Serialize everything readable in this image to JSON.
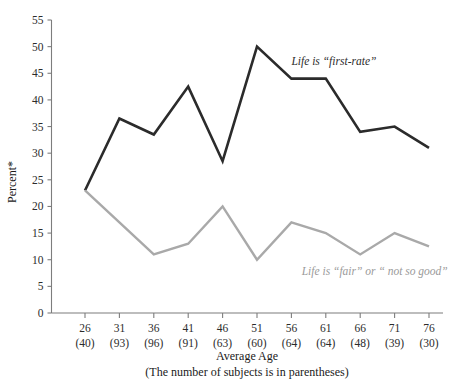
{
  "chart_data": {
    "type": "line",
    "title": "",
    "xlabel": "Average Age",
    "xnote": "(The number of subjects is in parentheses)",
    "ylabel": "Percent*",
    "ylim": [
      0,
      55
    ],
    "ytick_step": 5,
    "grid": false,
    "legend_position": "inline-annotation",
    "categories": [
      26,
      31,
      36,
      41,
      46,
      51,
      56,
      61,
      66,
      71,
      76
    ],
    "x": [
      26,
      31,
      36,
      41,
      46,
      51,
      56,
      61,
      66,
      71,
      76
    ],
    "xtick_labels": [
      "26",
      "31",
      "36",
      "41",
      "46",
      "51",
      "56",
      "61",
      "66",
      "71",
      "76"
    ],
    "xtick_sublabels": [
      "(40)",
      "(93)",
      "(96)",
      "(91)",
      "(63)",
      "(60)",
      "(64)",
      "(64)",
      "(48)",
      "(39)",
      "(30)"
    ],
    "subject_counts": [
      40,
      93,
      96,
      91,
      63,
      60,
      64,
      64,
      48,
      39,
      30
    ],
    "ytick_labels": [
      "0",
      "5",
      "10",
      "15",
      "20",
      "25",
      "30",
      "35",
      "40",
      "45",
      "50",
      "55"
    ],
    "ytick_values": [
      0,
      5,
      10,
      15,
      20,
      25,
      30,
      35,
      40,
      45,
      50,
      55
    ],
    "series": [
      {
        "name": "Life is \"first-rate\"",
        "color": "#2b2b2b",
        "values": [
          23,
          36.5,
          33.5,
          42.5,
          28.5,
          50,
          44,
          44,
          34,
          35,
          31
        ],
        "annotation": "Life is “first-rate”",
        "annotation_x": 56,
        "annotation_y": 46.5
      },
      {
        "name": "Life is \"fair\" or \" not so good\"",
        "color": "#a9a9a9",
        "values": [
          23,
          17,
          11,
          13,
          20,
          10,
          17,
          15,
          11,
          15,
          12.5
        ],
        "annotation": "Life is “fair” or “ not so good”",
        "annotation_x": 57.5,
        "annotation_y": 7.2
      }
    ]
  }
}
